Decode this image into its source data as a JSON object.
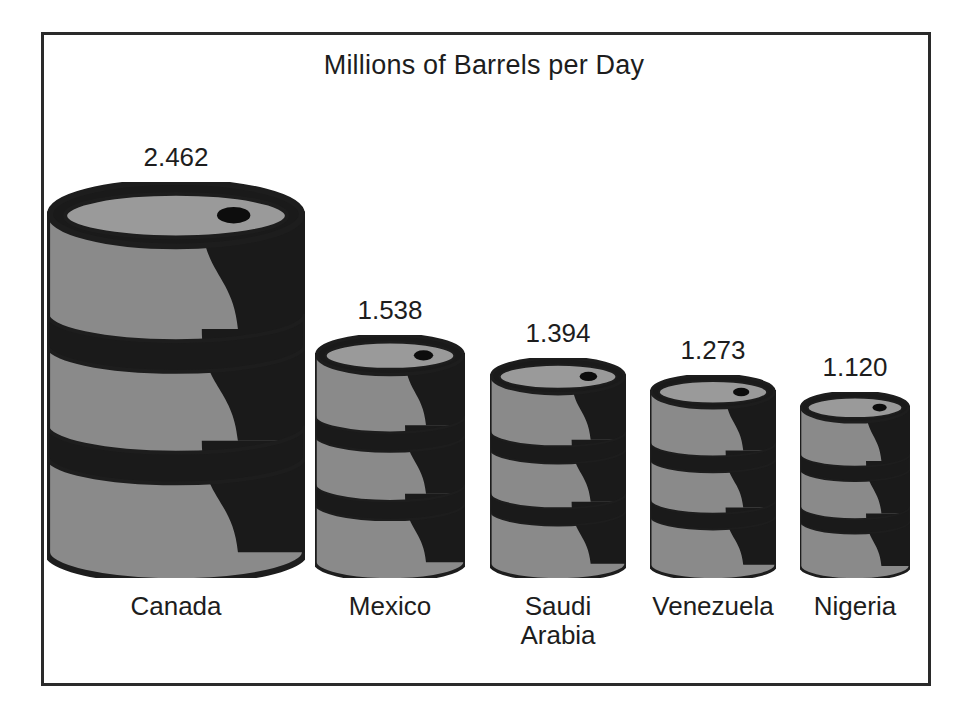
{
  "chart_data": {
    "type": "bar",
    "title": "Millions of Barrels per Day",
    "subtitle": "",
    "xlabel": "",
    "ylabel": "Millions of Barrels per Day",
    "grid": false,
    "legend": "none",
    "pictogram": "oil-barrel",
    "ylim": [
      0,
      2.462
    ],
    "categories": [
      "Canada",
      "Mexico",
      "Saudi Arabia",
      "Venezuela",
      "Nigeria"
    ],
    "values": [
      2.462,
      1.538,
      1.394,
      1.273,
      1.12
    ],
    "value_labels": [
      "2.462",
      "1.538",
      "1.394",
      "1.273",
      "1.120"
    ],
    "bars": [
      {
        "category": "Canada",
        "category_line1": "Canada",
        "category_line2": "",
        "value": 2.462,
        "value_label": "2.462",
        "x": 6,
        "width": 258,
        "height": 396
      },
      {
        "category": "Mexico",
        "category_line1": "Mexico",
        "category_line2": "",
        "value": 1.538,
        "value_label": "1.538",
        "x": 274,
        "width": 150,
        "height": 243
      },
      {
        "category": "Saudi Arabia",
        "category_line1": "Saudi",
        "category_line2": "Arabia",
        "value": 1.394,
        "value_label": "1.394",
        "x": 449,
        "width": 136,
        "height": 220
      },
      {
        "category": "Venezuela",
        "category_line1": "Venezuela",
        "category_line2": "",
        "value": 1.273,
        "value_label": "1.273",
        "x": 609,
        "width": 126,
        "height": 203
      },
      {
        "category": "Nigeria",
        "category_line1": "Nigeria",
        "category_line2": "",
        "value": 1.12,
        "value_label": "1.120",
        "x": 759,
        "width": 110,
        "height": 186
      }
    ]
  },
  "colors": {
    "barrel_body": "#8a8a8a",
    "barrel_shadow": "#1a1a1a",
    "barrel_outline": "#1d1d1d",
    "barrel_top": "#9a9a9a",
    "frame": "#2a2a2a",
    "text": "#1d1d1d",
    "background": "#ffffff"
  }
}
